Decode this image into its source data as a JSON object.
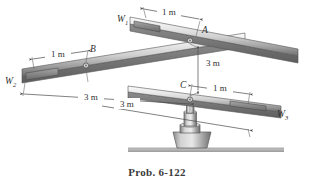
{
  "figure": {
    "caption": "Prob. 6-122",
    "colors": {
      "bar_light": "#f2f2f2",
      "bar_mid": "#b9b9b9",
      "bar_dark": "#6f6f6f",
      "weight_block": "#8d8d8d",
      "outline": "#5a5a5a",
      "dimension_line": "#4a4a4a",
      "ground": "#b0b0b0",
      "text": "#2f2f2f",
      "background": "#ffffff"
    },
    "weights": [
      {
        "id": "W1",
        "label": "W",
        "subscript": "1",
        "bar": "top-bar"
      },
      {
        "id": "W2",
        "label": "W",
        "subscript": "2",
        "bar": "middle-bar"
      },
      {
        "id": "W3",
        "label": "W",
        "subscript": "3",
        "bar": "lower-bar"
      }
    ],
    "pivots": [
      {
        "id": "A",
        "label": "A",
        "bar": "top-bar"
      },
      {
        "id": "B",
        "label": "B",
        "bar": "middle-bar"
      },
      {
        "id": "C",
        "label": "C",
        "bar": "lower-bar"
      }
    ],
    "dimensions": [
      {
        "id": "d-w1-a",
        "text": "1 m",
        "from": "W1",
        "to": "A"
      },
      {
        "id": "d-w2-b",
        "text": "1 m",
        "from": "W2",
        "to": "B"
      },
      {
        "id": "d-c-w3",
        "text": "1 m",
        "from": "C",
        "to": "W3"
      },
      {
        "id": "d-a-c",
        "text": "3 m",
        "from": "A",
        "to": "C"
      },
      {
        "id": "d-b-end",
        "text": "3 m",
        "from": "B",
        "to": "far-end"
      },
      {
        "id": "d-c-end",
        "text": "3 m",
        "from": "C",
        "to": "bar-end"
      }
    ],
    "support": {
      "name": "pedestal",
      "parts": [
        "shaft",
        "collar",
        "base-flange",
        "ground-line"
      ]
    }
  }
}
